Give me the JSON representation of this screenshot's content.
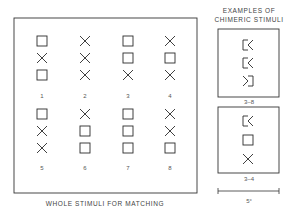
{
  "main_panel": {
    "caption": "WHOLE STIMULI FOR MATCHING",
    "stimuli": [
      {
        "label": "1",
        "shapes": [
          "square",
          "x",
          "square"
        ]
      },
      {
        "label": "2",
        "shapes": [
          "x",
          "x",
          "x"
        ]
      },
      {
        "label": "3",
        "shapes": [
          "square",
          "square",
          "x"
        ]
      },
      {
        "label": "4",
        "shapes": [
          "x",
          "square",
          "x"
        ]
      },
      {
        "label": "5",
        "shapes": [
          "square",
          "x",
          "x"
        ]
      },
      {
        "label": "6",
        "shapes": [
          "x",
          "square",
          "square"
        ]
      },
      {
        "label": "7",
        "shapes": [
          "square",
          "square",
          "square"
        ]
      },
      {
        "label": "8",
        "shapes": [
          "x",
          "x",
          "square"
        ]
      }
    ]
  },
  "chimeric_panel": {
    "title_line1": "EXAMPLES OF",
    "title_line2": "CHIMERIC STIMULI",
    "examples": [
      {
        "label": "3–8",
        "shapes": [
          "left-square-right-x",
          "left-square-right-x",
          "left-x-right-square"
        ]
      },
      {
        "label": "3–4",
        "shapes": [
          "left-square-right-x",
          "square",
          "x"
        ]
      }
    ]
  },
  "scale_bar": {
    "label": "5°"
  },
  "colors": {
    "stroke": "#2a2a2a",
    "background": "#ffffff"
  }
}
